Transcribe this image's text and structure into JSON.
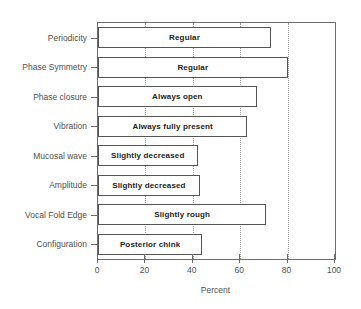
{
  "chart_data": {
    "type": "bar",
    "orientation": "horizontal",
    "title": "",
    "xlabel": "Percent",
    "ylabel": "",
    "xlim": [
      0,
      100
    ],
    "xticks": [
      0,
      20,
      40,
      60,
      80,
      100
    ],
    "xticklabels": [
      "0",
      "20",
      "40",
      "60",
      "80",
      "100"
    ],
    "grid": "vertical-dotted",
    "legend": "none",
    "categories": [
      "Periodicity",
      "Phase Symmetry",
      "Phase closure",
      "Vibration",
      "Mucosal wave",
      "Amplitude",
      "Vocal Fold Edge",
      "Configuration"
    ],
    "values": [
      73,
      80,
      67,
      63,
      42,
      43,
      71,
      44
    ],
    "bar_labels": [
      "Regular",
      "Regular",
      "Always  open",
      "Always fully present",
      "Slightly decreased",
      "Slightly decreased",
      "Slightly rough",
      "Posterior chink"
    ],
    "colors": {
      "bar_fill": "#ffffff",
      "bar_edge": "#555555",
      "grid": "#9a9a9a",
      "axis": "#6d6d6d",
      "text": "#4f4f4f",
      "bar_label_text": "#1c1c1c",
      "background": "#ffffff"
    }
  }
}
